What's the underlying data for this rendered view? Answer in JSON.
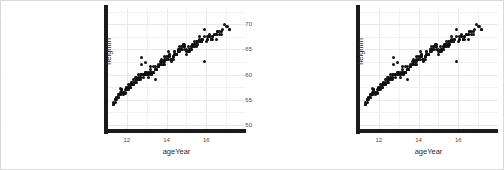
{
  "figure": {
    "background_color": "#ffffff",
    "border_color": "#d9d9d9",
    "panel_background": "#ffffff",
    "grid_color": "#e8e8e8",
    "axis_color": "#1a1a1a",
    "point_color": "#111111"
  },
  "chart_data": [
    {
      "type": "scatter",
      "title": "",
      "xlabel": "ageYear",
      "ylabel": "heightIn",
      "xlim": [
        11.0,
        18.0
      ],
      "ylim": [
        49.0,
        73.0
      ],
      "xticks": [
        "12",
        "14",
        "16"
      ],
      "xtick_values": [
        12,
        14,
        16
      ],
      "yticks": [
        "50",
        "55",
        "60",
        "65",
        "70"
      ],
      "ytick_values": [
        50,
        55,
        60,
        65,
        70
      ],
      "grid": true,
      "legend": "none",
      "marker": "filled-circle",
      "x": [
        11.92,
        12.92,
        12.75,
        13.42,
        15.92,
        14.25,
        15.42,
        11.83,
        13.33,
        11.67,
        15.08,
        13.17,
        12.42,
        12.58,
        14.5,
        13.58,
        14.92,
        11.58,
        13.75,
        13.92,
        16.5,
        14.08,
        14.75,
        13.08,
        15.58,
        12.08,
        11.75,
        17.17,
        16.08,
        12.25,
        14.33,
        15.17,
        11.5,
        12.67,
        13.5,
        14.67,
        13.25,
        12.33,
        15.33,
        16.25,
        12.17,
        14.17,
        15.75,
        13.83,
        11.42,
        16.75,
        14.42,
        12.5,
        13.67,
        15.5,
        12.83,
        14.58,
        15.25,
        13.0,
        16.33,
        11.33,
        14.83,
        12.0,
        15.0,
        13.42,
        12.75,
        14.25,
        11.92,
        16.17,
        13.33,
        15.83,
        12.58,
        14.0,
        13.17,
        15.67,
        12.42,
        14.92,
        11.83,
        16.42,
        13.58,
        15.42,
        12.92,
        14.5,
        13.75,
        11.67,
        15.08,
        16.58,
        12.25,
        14.08,
        13.92,
        15.17,
        12.08,
        14.75,
        13.08,
        16.08,
        11.75,
        15.58,
        12.67,
        14.33,
        13.5,
        17.08,
        12.5,
        14.67,
        13.25,
        15.33,
        11.58,
        16.25,
        12.33,
        14.17,
        13.83,
        15.75,
        12.17,
        14.42,
        11.42,
        16.75,
        13.67,
        15.5,
        12.83,
        14.58,
        13.0,
        15.25,
        11.33,
        16.33,
        12.0,
        14.83,
        13.42,
        15.0,
        12.75,
        14.25,
        11.92,
        16.5,
        13.33,
        15.92,
        12.58,
        14.0,
        13.17,
        15.67,
        12.42,
        14.92,
        11.83,
        16.17,
        13.58,
        15.42,
        12.92,
        14.5,
        13.75,
        11.67,
        15.08,
        16.67,
        12.25,
        14.08,
        13.92,
        15.17,
        12.08,
        14.75,
        13.08,
        16.08,
        11.75,
        15.58,
        12.67,
        14.33,
        13.5,
        17.17,
        12.5,
        14.67,
        13.25,
        15.33,
        11.58,
        16.25,
        12.33,
        14.17,
        13.83,
        15.75,
        12.17,
        14.42,
        11.5,
        16.92,
        13.67,
        15.5,
        12.83,
        14.58,
        13.0,
        15.25,
        11.42,
        16.42,
        12.0,
        14.83,
        13.42,
        15.0,
        12.92,
        14.33,
        11.67,
        16.58,
        13.25,
        15.83,
        12.5,
        14.08,
        13.58,
        15.5,
        12.33,
        14.92,
        11.83,
        16.0,
        13.75,
        15.33,
        12.67,
        14.5,
        13.08,
        11.75,
        15.17,
        16.83,
        12.42,
        14.25,
        13.92,
        15.67,
        12.08,
        14.67,
        13.33,
        16.17,
        11.58,
        15.75,
        12.75,
        14.42,
        13.5,
        17.0,
        12.58,
        14.75,
        13.17,
        15.42,
        11.33,
        16.33,
        12.25,
        14.0,
        13.67,
        15.92,
        12.17,
        14.58,
        11.42,
        16.67,
        13.83,
        15.08,
        12.83,
        14.17,
        13.0,
        15.58,
        11.5,
        16.5,
        12.0,
        14.83,
        13.42,
        15.25
      ],
      "y": [
        56.3,
        62.3,
        63.3,
        59.0,
        62.5,
        62.5,
        66.5,
        56.5,
        61.5,
        57.3,
        65.5,
        61.5,
        59.5,
        60.0,
        64.0,
        62.0,
        66.0,
        56.0,
        63.0,
        63.5,
        67.0,
        64.5,
        65.0,
        60.5,
        66.5,
        58.0,
        57.0,
        69.0,
        67.5,
        58.5,
        63.5,
        65.0,
        55.5,
        60.0,
        61.0,
        65.5,
        60.5,
        59.0,
        66.0,
        67.0,
        58.0,
        64.0,
        67.0,
        62.5,
        55.0,
        68.5,
        64.5,
        59.5,
        62.0,
        66.5,
        60.0,
        65.0,
        65.5,
        60.0,
        67.5,
        54.5,
        66.0,
        57.5,
        65.0,
        61.0,
        62.0,
        63.0,
        57.0,
        68.0,
        60.5,
        67.0,
        59.5,
        63.5,
        61.0,
        67.5,
        59.0,
        65.5,
        56.5,
        68.0,
        61.5,
        66.0,
        60.5,
        64.0,
        62.5,
        56.0,
        64.5,
        68.5,
        58.5,
        63.5,
        63.0,
        65.0,
        57.5,
        65.5,
        60.0,
        67.0,
        57.0,
        66.5,
        59.5,
        63.5,
        61.0,
        69.5,
        59.0,
        65.0,
        60.5,
        66.0,
        56.0,
        67.0,
        58.5,
        64.0,
        62.0,
        66.5,
        58.0,
        64.5,
        55.0,
        68.0,
        62.5,
        66.0,
        60.0,
        65.0,
        60.5,
        65.5,
        54.0,
        67.5,
        57.5,
        66.0,
        61.5,
        64.5,
        60.0,
        63.0,
        56.5,
        68.0,
        60.5,
        69.0,
        59.0,
        63.0,
        60.5,
        67.0,
        58.5,
        65.5,
        56.0,
        67.5,
        61.5,
        66.0,
        60.0,
        64.0,
        62.0,
        56.5,
        64.5,
        68.5,
        58.0,
        63.5,
        62.5,
        65.0,
        57.0,
        65.0,
        59.5,
        67.0,
        56.5,
        66.0,
        59.0,
        63.0,
        61.0,
        69.0,
        58.5,
        64.5,
        60.0,
        65.5,
        55.5,
        67.0,
        58.0,
        63.5,
        62.0,
        66.5,
        57.5,
        64.0,
        55.0,
        70.0,
        62.0,
        65.5,
        59.5,
        64.5,
        60.0,
        65.0,
        54.5,
        68.0,
        57.0,
        65.5,
        61.0,
        64.0,
        60.5,
        63.5,
        56.0,
        68.5,
        60.0,
        67.0,
        59.0,
        63.0,
        61.5,
        66.0,
        58.0,
        65.0,
        56.5,
        66.5,
        62.5,
        65.5,
        59.5,
        64.0,
        60.0,
        57.0,
        64.5,
        69.0,
        58.5,
        63.0,
        62.0,
        66.5,
        57.5,
        65.0,
        60.5,
        67.5,
        55.5,
        66.5,
        60.0,
        64.0,
        61.0,
        69.5,
        59.0,
        65.0,
        60.5,
        65.5,
        54.0,
        67.0,
        58.0,
        63.0,
        62.0,
        67.5,
        57.5,
        64.5,
        55.0,
        68.0,
        62.5,
        64.5,
        60.0,
        63.5,
        60.5,
        66.0,
        55.5,
        68.0,
        57.0,
        65.5,
        61.0,
        65.0
      ]
    },
    {
      "type": "scatter",
      "title": "",
      "xlabel": "ageYear",
      "ylabel": "heightIn",
      "xlim": [
        11.0,
        18.0
      ],
      "ylim": [
        49.0,
        73.0
      ],
      "xticks": [
        "12",
        "14",
        "16"
      ],
      "xtick_values": [
        12,
        14,
        16
      ],
      "yticks": [
        "50",
        "55",
        "60",
        "65",
        "70"
      ],
      "ytick_values": [
        50,
        55,
        60,
        65,
        70
      ],
      "grid": true,
      "legend": "none",
      "marker": "filled-circle",
      "same_as_panel": 0
    }
  ]
}
